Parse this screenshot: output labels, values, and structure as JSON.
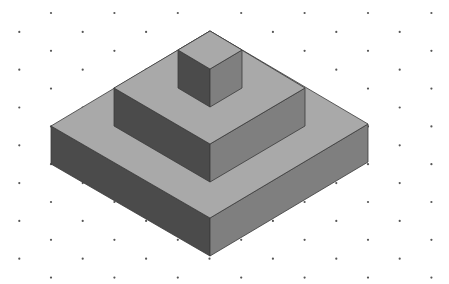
{
  "diagram": {
    "type": "isometric-stepped-pyramid",
    "width": 449,
    "height": 284,
    "background": "#ffffff",
    "grid": {
      "style": "isometric-dot-grid",
      "dot_color": "#555555",
      "dot_radius": 1.1,
      "x_step": 63.4,
      "y_step": 18.9,
      "y_start": 13,
      "rows": 15,
      "odd_row_x_start": 51,
      "even_row_x_start": 19.3
    },
    "colors": {
      "top": "#a9a9a9",
      "left": "#4b4b4b",
      "right": "#7f7f7f",
      "edge": "#3a3a3a"
    },
    "tiers": [
      {
        "name": "bottom-slab",
        "top_face": [
          [
            210,
            31
          ],
          [
            368,
            124
          ],
          [
            210,
            218
          ],
          [
            51,
            126
          ]
        ],
        "left_face": [
          [
            51,
            126
          ],
          [
            210,
            218
          ],
          [
            210,
            256
          ],
          [
            51,
            164
          ]
        ],
        "right_face": [
          [
            210,
            218
          ],
          [
            368,
            124
          ],
          [
            368,
            162
          ],
          [
            210,
            256
          ]
        ]
      },
      {
        "name": "middle-slab",
        "top_face": [
          [
            210,
            31
          ],
          [
            305,
            88
          ],
          [
            210,
            144
          ],
          [
            114,
            88
          ]
        ],
        "left_face": [
          [
            114,
            88
          ],
          [
            210,
            144
          ],
          [
            210,
            182
          ],
          [
            114,
            126
          ]
        ],
        "right_face": [
          [
            210,
            144
          ],
          [
            305,
            88
          ],
          [
            305,
            126
          ],
          [
            210,
            182
          ]
        ]
      },
      {
        "name": "top-cube",
        "top_face": [
          [
            210,
            31
          ],
          [
            242,
            50
          ],
          [
            210,
            69
          ],
          [
            178,
            50
          ]
        ],
        "left_face": [
          [
            178,
            50
          ],
          [
            210,
            69
          ],
          [
            210,
            107
          ],
          [
            178,
            88
          ]
        ],
        "right_face": [
          [
            210,
            69
          ],
          [
            242,
            50
          ],
          [
            242,
            88
          ],
          [
            210,
            107
          ]
        ]
      }
    ]
  }
}
